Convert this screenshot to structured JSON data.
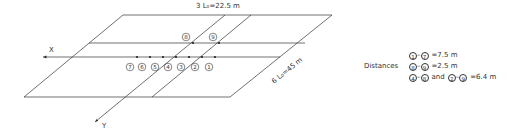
{
  "diagram": {
    "title_top": "3 L₀=22.5 m",
    "side_label": "6 L₀=45 m",
    "axis_x_label": "X",
    "axis_y_label": "Y",
    "line_color": "#333333",
    "points_row": [
      {
        "id": "7",
        "label": "7",
        "x": 137,
        "lx": 130
      },
      {
        "id": "6",
        "label": "6",
        "x": 150,
        "lx": 142
      },
      {
        "id": "5",
        "label": "5",
        "x": 163,
        "lx": 155
      },
      {
        "id": "4",
        "label": "4",
        "x": 176,
        "lx": 168
      },
      {
        "id": "3",
        "label": "3",
        "x": 189,
        "lx": 181
      },
      {
        "id": "2",
        "label": "2",
        "x": 202,
        "lx": 195
      },
      {
        "id": "1",
        "label": "1",
        "x": 215,
        "lx": 209
      }
    ],
    "points_upper": [
      {
        "id": "8",
        "label": "8",
        "x": 193,
        "lx": 186
      },
      {
        "id": "9",
        "label": "9",
        "x": 219,
        "lx": 213
      }
    ]
  },
  "legend": {
    "title": "Distances",
    "rows": [
      {
        "a": "1",
        "b": "7",
        "sep": "–",
        "value": "=7.5 m"
      },
      {
        "a": "8",
        "b": "9",
        "sep": "–",
        "value": "=2.5 m"
      },
      {
        "a": "4",
        "b": "8",
        "sep": "–",
        "conj": "and",
        "c": "2",
        "d": "9",
        "value": "=6.4 m"
      }
    ]
  }
}
